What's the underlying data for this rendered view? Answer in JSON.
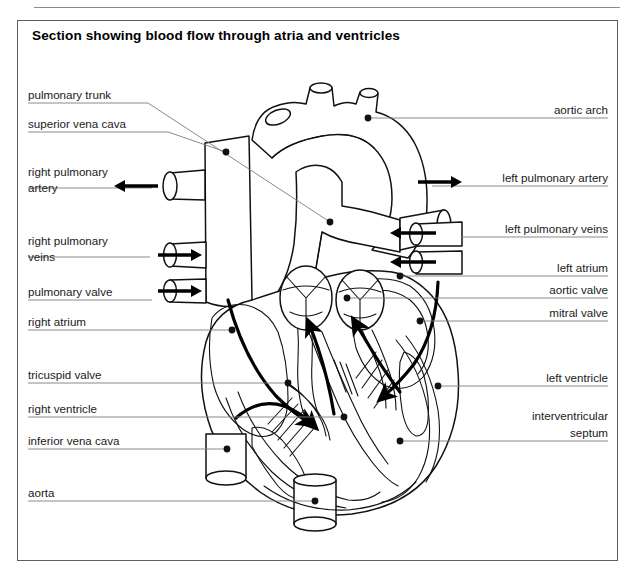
{
  "figure": {
    "title": "Section showing blood flow through atria and ventricles",
    "frame_border_color": "#5d5d5d",
    "ink_color": "#111111",
    "leader_color": "#7d7d7d"
  },
  "labels_left": [
    {
      "id": "pulmonary-trunk",
      "text": "pulmonary trunk",
      "x": 28,
      "y": 99,
      "leader_y": 103,
      "leader_x2": 148,
      "target_x": 330,
      "target_y": 222
    },
    {
      "id": "superior-vena-cava",
      "text": "superior vena cava",
      "x": 28,
      "y": 128,
      "leader_y": 132,
      "leader_x2": 168,
      "target_x": 226,
      "target_y": 152
    },
    {
      "id": "right-pulmonary-artery",
      "text": "right pulmonary",
      "text2": "artery",
      "x": 28,
      "y": 176,
      "y2": 192,
      "leader_y": 188,
      "leader_x2": 152,
      "arrow": "left",
      "arrow_x": 196,
      "arrow_y": 186
    },
    {
      "id": "right-pulmonary-veins",
      "text": "right pulmonary",
      "text2": "veins",
      "x": 28,
      "y": 245,
      "y2": 261,
      "leader_y": 257,
      "leader_x2": 150,
      "arrow": "right",
      "arrow_x": 158,
      "arrow_y": 255
    },
    {
      "id": "pulmonary-valve",
      "text": "pulmonary valve",
      "x": 28,
      "y": 296,
      "leader_y": 300,
      "leader_x2": 152,
      "arrow": "right",
      "arrow_x": 158,
      "arrow_y": 291
    },
    {
      "id": "right-atrium",
      "text": "right atrium",
      "x": 28,
      "y": 326,
      "leader_y": 330,
      "leader_x2": 232,
      "target_x": 232,
      "target_y": 330
    },
    {
      "id": "tricuspid-valve",
      "text": "tricuspid valve",
      "x": 28,
      "y": 379,
      "leader_y": 383,
      "leader_x2": 288,
      "target_x": 288,
      "target_y": 383
    },
    {
      "id": "right-ventricle",
      "text": "right ventricle",
      "x": 28,
      "y": 413,
      "leader_y": 417,
      "leader_x2": 344,
      "target_x": 344,
      "target_y": 417
    },
    {
      "id": "inferior-vena-cava",
      "text": "inferior vena cava",
      "x": 28,
      "y": 445,
      "leader_y": 449,
      "leader_x2": 227,
      "target_x": 227,
      "target_y": 449
    },
    {
      "id": "aorta",
      "text": "aorta",
      "x": 28,
      "y": 497,
      "leader_y": 501,
      "leader_x2": 315,
      "target_x": 315,
      "target_y": 501
    }
  ],
  "labels_right": [
    {
      "id": "aortic-arch",
      "text": "aortic arch",
      "x": 608,
      "y": 114,
      "leader_y": 118,
      "leader_x2": 368,
      "target_x": 368,
      "target_y": 118
    },
    {
      "id": "left-pulmonary-artery",
      "text": "left pulmonary artery",
      "x": 608,
      "y": 182,
      "leader_y": 186,
      "leader_x2": 432,
      "arrow": "right",
      "arrow_x": 410,
      "arrow_y": 182
    },
    {
      "id": "left-pulmonary-veins",
      "text": "left pulmonary veins",
      "x": 608,
      "y": 233,
      "leader_y": 237,
      "leader_x2": 462,
      "arrow": "left",
      "arrow_x": 486,
      "arrow_y": 233
    },
    {
      "id": "left-atrium",
      "text": "left atrium",
      "x": 608,
      "y": 272,
      "leader_y": 276,
      "leader_x2": 400,
      "target_x": 400,
      "target_y": 276
    },
    {
      "id": "aortic-valve",
      "text": "aortic valve",
      "x": 608,
      "y": 294,
      "leader_y": 298,
      "leader_x2": 347,
      "target_x": 347,
      "target_y": 298
    },
    {
      "id": "mitral-valve",
      "text": "mitral valve",
      "x": 608,
      "y": 317,
      "leader_y": 321,
      "leader_x2": 420,
      "target_x": 420,
      "target_y": 321
    },
    {
      "id": "left-ventricle",
      "text": "left ventricle",
      "x": 608,
      "y": 382,
      "leader_y": 386,
      "leader_x2": 438,
      "target_x": 438,
      "target_y": 386
    },
    {
      "id": "interventricular-septum",
      "text": "interventricular",
      "text2": "septum",
      "x": 608,
      "y": 420,
      "y2": 437,
      "leader_y": 441,
      "leader_x2": 400,
      "target_x": 400,
      "target_y": 441
    }
  ],
  "vessel_arrows": [
    {
      "id": "rpa-arrow",
      "direction": "left",
      "x": 158,
      "y": 186,
      "length": 44
    },
    {
      "id": "rpv-arrow1",
      "direction": "right",
      "x": 158,
      "y": 255,
      "length": 44
    },
    {
      "id": "rpv-arrow2",
      "direction": "right",
      "x": 158,
      "y": 291,
      "length": 44
    },
    {
      "id": "lpa-arrow",
      "direction": "right",
      "x": 418,
      "y": 182,
      "length": 44
    },
    {
      "id": "lpv-arrow1",
      "direction": "left",
      "x": 436,
      "y": 233,
      "length": 46
    },
    {
      "id": "lpv-arrow2",
      "direction": "left",
      "x": 436,
      "y": 262,
      "length": 46
    }
  ],
  "flow_arrows": [
    {
      "id": "flow-right-atrium-to-ventricle",
      "description": "right atrium into right ventricle"
    },
    {
      "id": "flow-right-ventricle-to-pulmonary-trunk",
      "description": "right ventricle up to pulmonary valve"
    },
    {
      "id": "flow-left-atrium-to-ventricle",
      "description": "left atrium into left ventricle"
    },
    {
      "id": "flow-left-ventricle-to-aorta",
      "description": "left ventricle up to aortic valve"
    }
  ]
}
